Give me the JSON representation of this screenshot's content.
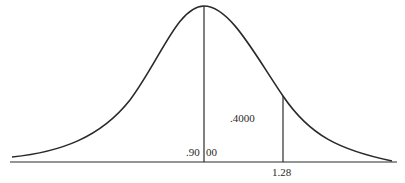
{
  "diagram": {
    "type": "normal-distribution-curve",
    "labels": {
      "left_area": ".90",
      "right_area": "00",
      "shaded_area": ".4000",
      "z_value": "1.28"
    },
    "colors": {
      "stroke": "#2a2a2a",
      "background": "#ffffff"
    }
  }
}
